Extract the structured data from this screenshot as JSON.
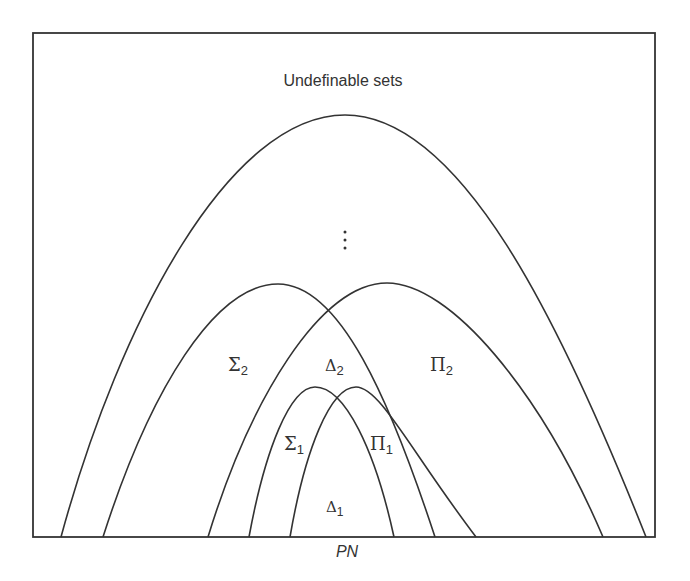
{
  "diagram": {
    "title": "Undefinable sets",
    "ellipsis": "⋮",
    "base_label": "PN",
    "regions": {
      "sigma2": {
        "symbol": "Σ",
        "sub": "2"
      },
      "delta2": {
        "symbol": "Δ",
        "sub": "2"
      },
      "pi2": {
        "symbol": "Π",
        "sub": "2"
      },
      "sigma1": {
        "symbol": "Σ",
        "sub": "1"
      },
      "pi1": {
        "symbol": "Π",
        "sub": "1"
      },
      "delta1": {
        "symbol": "Δ",
        "sub": "1"
      }
    },
    "line_color": "#333333"
  }
}
